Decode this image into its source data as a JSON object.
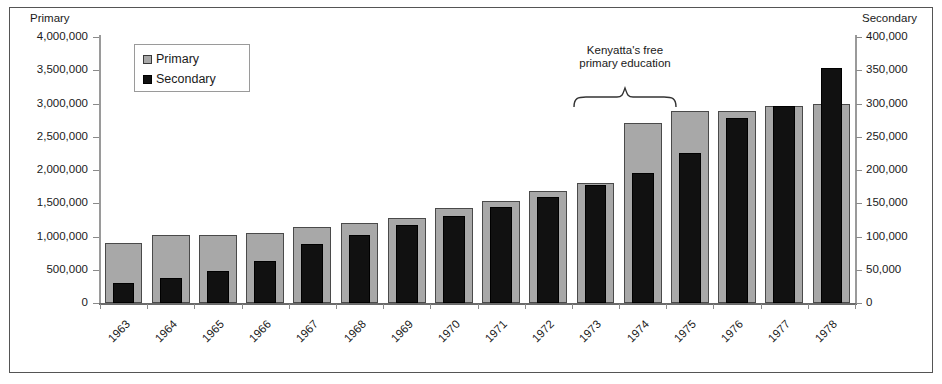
{
  "axes": {
    "left_title": "Primary",
    "right_title": "Secondary",
    "left_ticks": [
      "4,000,000",
      "3,500,000",
      "3,000,000",
      "2,500,000",
      "2,000,000",
      "1,500,000",
      "1,000,000",
      "500,000",
      "0"
    ],
    "right_ticks": [
      "400,000",
      "350,000",
      "300,000",
      "250,000",
      "200,000",
      "150,000",
      "100,000",
      "50,000",
      "0"
    ]
  },
  "legend": {
    "items": [
      {
        "label": "Primary",
        "color": "#a8a8a8",
        "swatch": "primary"
      },
      {
        "label": "Secondary",
        "color": "#111111",
        "swatch": "secondary"
      }
    ]
  },
  "annotation": {
    "line1": "Kenyatta's free",
    "line2": "primary education",
    "brace_icon": "curly-brace-up-icon",
    "spans_categories": [
      "1973",
      "1974"
    ]
  },
  "chart_data": {
    "type": "bar",
    "title": "",
    "xlabel": "",
    "grid": false,
    "legend_position": "top-left",
    "categories": [
      "1963",
      "1964",
      "1965",
      "1966",
      "1967",
      "1968",
      "1969",
      "1970",
      "1971",
      "1972",
      "1973",
      "1974",
      "1975",
      "1976",
      "1977",
      "1978"
    ],
    "series": [
      {
        "name": "Primary",
        "axis": "left",
        "ylabel": "Primary",
        "ylim": [
          0,
          4000000
        ],
        "color": "#a8a8a8",
        "values": [
          900000,
          1030000,
          1030000,
          1050000,
          1140000,
          1210000,
          1280000,
          1430000,
          1530000,
          1680000,
          1810000,
          2700000,
          2880000,
          2890000,
          2970000,
          3000000
        ]
      },
      {
        "name": "Secondary",
        "axis": "right",
        "ylabel": "Secondary",
        "ylim": [
          0,
          400000
        ],
        "color": "#111111",
        "values": [
          30000,
          37000,
          48000,
          63000,
          88000,
          103000,
          117000,
          131000,
          144000,
          160000,
          178000,
          195000,
          226000,
          278000,
          296000,
          354000
        ]
      }
    ]
  }
}
